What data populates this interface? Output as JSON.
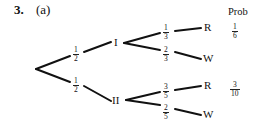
{
  "question": {
    "number": "3.",
    "part": "(a)"
  },
  "header": {
    "prob": "Prob"
  },
  "tree": {
    "first_level": [
      {
        "label": "I",
        "branch_prob": {
          "num": "1",
          "den": "2"
        }
      },
      {
        "label": "II",
        "branch_prob": {
          "num": "1",
          "den": "2"
        }
      }
    ],
    "second_level": {
      "I": [
        {
          "outcome": "R",
          "branch_prob": {
            "num": "1",
            "den": "3"
          },
          "prob": {
            "num": "1",
            "den": "6"
          }
        },
        {
          "outcome": "W",
          "branch_prob": {
            "num": "2",
            "den": "3"
          }
        }
      ],
      "II": [
        {
          "outcome": "R",
          "branch_prob": {
            "num": "3",
            "den": "5"
          },
          "prob": {
            "num": "3",
            "den": "10"
          }
        },
        {
          "outcome": "W",
          "branch_prob": {
            "num": "2",
            "den": "5"
          }
        }
      ]
    }
  }
}
